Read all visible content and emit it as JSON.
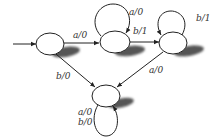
{
  "diagram": {
    "type": "finite-state-machine",
    "states": [
      {
        "id": "s1",
        "cx": 50,
        "cy": 44,
        "rx": 14,
        "ry": 11,
        "initial": true
      },
      {
        "id": "s2",
        "cx": 115,
        "cy": 42,
        "rx": 15,
        "ry": 11
      },
      {
        "id": "s3",
        "cx": 173,
        "cy": 43,
        "rx": 14,
        "ry": 11
      },
      {
        "id": "s4",
        "cx": 106,
        "cy": 96,
        "rx": 14,
        "ry": 11
      }
    ],
    "transitions": [
      {
        "from": "s1",
        "to": "s2",
        "label": "a/0"
      },
      {
        "from": "s2",
        "to": "s2",
        "label": "a/0"
      },
      {
        "from": "s2",
        "to": "s3",
        "label": "b/1"
      },
      {
        "from": "s3",
        "to": "s3",
        "label": "b/1"
      },
      {
        "from": "s1",
        "to": "s4",
        "label": "b/0"
      },
      {
        "from": "s3",
        "to": "s4",
        "label": "a/0"
      },
      {
        "from": "s4",
        "to": "s4",
        "label": "a/0"
      },
      {
        "from": "s4",
        "to": "s4",
        "label": "b/0"
      }
    ],
    "labels": {
      "s1_s2": "a/0",
      "s2_loop": "a/0",
      "s2_s3": "b/1",
      "s3_loop": "b/1",
      "s1_s4": "b/0",
      "s3_s4": "a/0",
      "s4_loop_a": "a/0",
      "s4_loop_b": "b/0"
    },
    "colors": {
      "stroke": "#222222",
      "shadow": "#555555",
      "text": "#333333"
    }
  }
}
